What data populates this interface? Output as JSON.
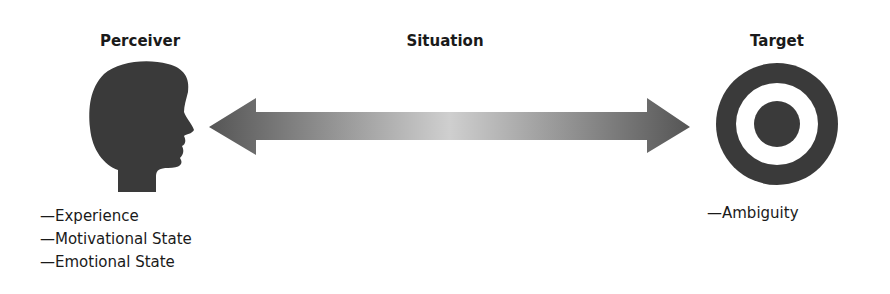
{
  "perceiver": {
    "title": "Perceiver",
    "icon": "head-silhouette-icon",
    "factors": [
      "—Experience",
      "—Motivational State",
      "—Emotional State"
    ]
  },
  "situation": {
    "title": "Situation",
    "icon": "double-arrow-icon"
  },
  "target": {
    "title": "Target",
    "icon": "bullseye-icon",
    "factors": [
      "—Ambiguity"
    ]
  },
  "colors": {
    "dark": "#3a3a3a",
    "arrow_end": "#5a5a5a",
    "arrow_mid": "#c8c8c8"
  }
}
